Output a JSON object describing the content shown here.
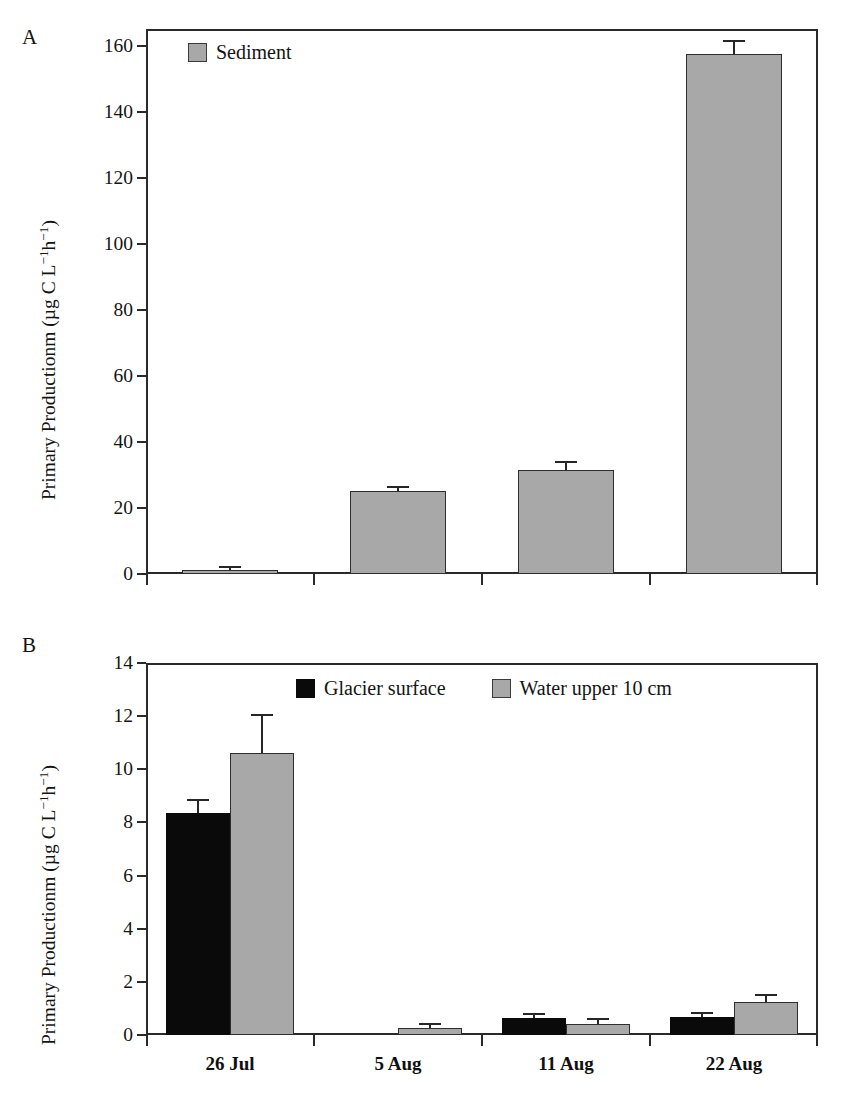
{
  "figure": {
    "panel_a_letter": "A",
    "panel_b_letter": "B",
    "ylabel_parts": {
      "pre": "Primary Productionm (µg C L",
      "sup1": "−1",
      "mid": "h",
      "sup2": "−1",
      "post": ")"
    },
    "ylabel_text": "Primary Productionm (µg C L−1h−1)"
  },
  "chart_data": [
    {
      "id": "panel-a",
      "type": "bar",
      "title": "A",
      "xlabel": "",
      "ylabel": "Primary Productionm (µg C L−1h−1)",
      "ylim": [
        0,
        165
      ],
      "yticks": [
        0,
        20,
        40,
        60,
        80,
        100,
        120,
        140,
        160
      ],
      "ytick_labels": [
        "0",
        "20",
        "40",
        "60",
        "80",
        "100",
        "120",
        "140",
        "160"
      ],
      "grid": false,
      "legend_position": "top-left",
      "categories": [
        "26 Jul",
        "5 Aug",
        "11 Aug",
        "22 Aug"
      ],
      "series": [
        {
          "name": "Sediment",
          "color": "#a8a8a8",
          "values": [
            1.2,
            25.0,
            31.5,
            157.5
          ],
          "errors": [
            0.5,
            0.9,
            2.0,
            3.5
          ]
        }
      ]
    },
    {
      "id": "panel-b",
      "type": "bar",
      "title": "B",
      "xlabel": "",
      "ylabel": "Primary Productionm (µg C L−1h−1)",
      "ylim": [
        0,
        14
      ],
      "yticks": [
        0,
        2,
        4,
        6,
        8,
        10,
        12,
        14
      ],
      "ytick_labels": [
        "0",
        "2",
        "4",
        "6",
        "8",
        "10",
        "12",
        "14"
      ],
      "grid": false,
      "legend_position": "top-center",
      "categories": [
        "26 Jul",
        "5 Aug",
        "11 Aug",
        "22 Aug"
      ],
      "series": [
        {
          "name": "Glacier surface",
          "color": "#0a0a0a",
          "values": [
            8.35,
            0.0,
            0.65,
            0.68
          ],
          "errors": [
            0.45,
            0.0,
            0.09,
            0.12
          ]
        },
        {
          "name": "Water upper 10 cm",
          "color": "#a8a8a8",
          "values": [
            10.6,
            0.28,
            0.4,
            1.25
          ],
          "errors": [
            1.4,
            0.1,
            0.18,
            0.2
          ]
        }
      ]
    }
  ]
}
